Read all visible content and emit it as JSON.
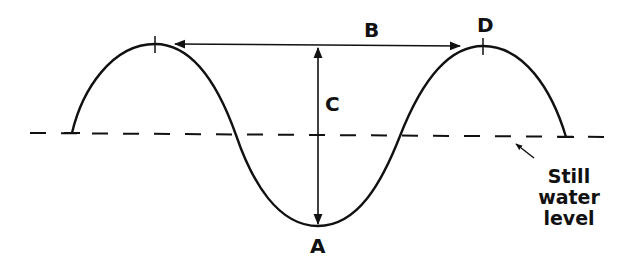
{
  "diagram": {
    "title": "",
    "type": "wave anatomy",
    "labels": {
      "A": "A",
      "B": "B",
      "C": "C",
      "D": "D"
    },
    "annotation": {
      "line1": "Still",
      "line2": "water",
      "line3": "level"
    },
    "elements": [
      {
        "id": "A",
        "meaning": "trough"
      },
      {
        "id": "B",
        "meaning": "wavelength (crest to crest)"
      },
      {
        "id": "C",
        "meaning": "wave height (crest to trough)"
      },
      {
        "id": "D",
        "meaning": "crest"
      }
    ],
    "colors": {
      "line": "#111111",
      "background": "#ffffff"
    }
  }
}
